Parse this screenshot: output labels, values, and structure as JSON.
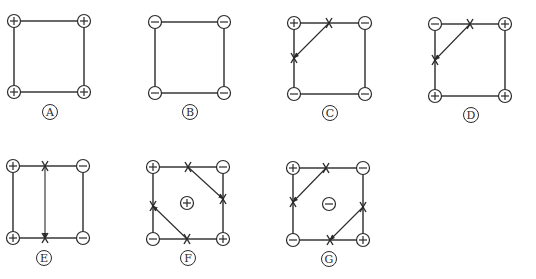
{
  "figure": {
    "panels": [
      {
        "label": "A",
        "corners": {
          "tl": "+",
          "tr": "+",
          "bl": "+",
          "br": "+"
        },
        "center": null
      },
      {
        "label": "B",
        "corners": {
          "tl": "−",
          "tr": "−",
          "bl": "−",
          "br": "−"
        },
        "center": null
      },
      {
        "label": "C",
        "corners": {
          "tl": "+",
          "tr": "−",
          "bl": "−",
          "br": "−"
        },
        "center": null
      },
      {
        "label": "D",
        "corners": {
          "tl": "−",
          "tr": "+",
          "bl": "+",
          "br": "+"
        },
        "center": null
      },
      {
        "label": "E",
        "corners": {
          "tl": "+",
          "tr": "−",
          "bl": "+",
          "br": "−"
        },
        "center": null
      },
      {
        "label": "F",
        "corners": {
          "tl": "+",
          "tr": "−",
          "bl": "−",
          "br": "+"
        },
        "center": "+"
      },
      {
        "label": "G",
        "corners": {
          "tl": "+",
          "tr": "−",
          "bl": "−",
          "br": "+"
        },
        "center": "−"
      }
    ]
  },
  "colors": {
    "stroke": "#2a2a2a",
    "background": "#ffffff"
  }
}
